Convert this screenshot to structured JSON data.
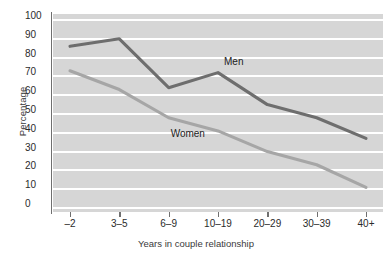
{
  "chart_data": {
    "type": "line",
    "title": "",
    "xlabel": "Years in couple relationship",
    "ylabel": "Percentage",
    "categories": [
      "–2",
      "3–5",
      "6–9",
      "10–19",
      "20–29",
      "30–39",
      "40+"
    ],
    "ylim": [
      0,
      100
    ],
    "yticks": [
      0,
      10,
      20,
      30,
      40,
      50,
      60,
      70,
      80,
      90,
      100
    ],
    "ytick_labels": [
      "0",
      "10",
      "20",
      "30",
      "40",
      "50",
      "60",
      "70",
      "80",
      "90",
      "100"
    ],
    "grid": "horizontal-white-gridlines",
    "legend": "inline-series-labels",
    "series": [
      {
        "name": "Men",
        "color": "#6e6e6e",
        "values": [
          86,
          90,
          64,
          72,
          55,
          48,
          37
        ],
        "label_position": "above-line-at-10-19"
      },
      {
        "name": "Women",
        "color": "#a6a6a6",
        "values": [
          73,
          63,
          48,
          41,
          30,
          23,
          11
        ],
        "label_position": "below-line-at-6-9"
      }
    ],
    "plot_background": "#d6d6d6",
    "gridline_color": "#ffffff",
    "axis_color": "#6f6f6f"
  }
}
